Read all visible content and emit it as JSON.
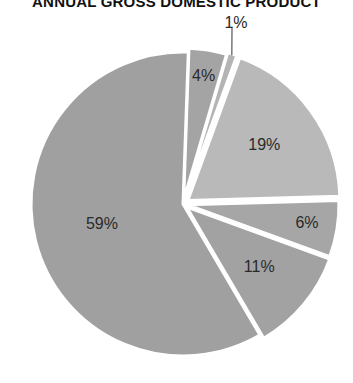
{
  "chart_data": {
    "type": "pie",
    "title": "ANNUAL GROSS DOMESTIC PRODUCT",
    "categories": [
      "Slice A",
      "Slice B",
      "Slice C",
      "Slice D",
      "Slice E",
      "Slice F"
    ],
    "values": [
      4,
      1,
      19,
      6,
      11,
      59
    ],
    "labels": [
      "4%",
      "1%",
      "19%",
      "6%",
      "11%",
      "59%"
    ],
    "colors": [
      "#a4a4a4",
      "#b4b4b4",
      "#b9b9b9",
      "#a6a6a6",
      "#a2a2a2",
      "#a0a0a0"
    ],
    "start_angle_deg": 2,
    "direction": "clockwise",
    "exploded": true,
    "legend": "none"
  }
}
